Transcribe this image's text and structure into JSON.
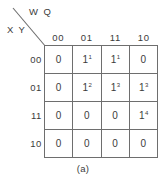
{
  "figure": {
    "caption": "(a)",
    "line_color": "#6e6e6e",
    "text_color": "#3b3b3b",
    "background": "#ffffff"
  },
  "axis_labels": {
    "top": "W Q",
    "left": "X Y"
  },
  "chart_data": {
    "type": "table",
    "title": "",
    "subtitle": "",
    "xlabel": "W Q",
    "ylabel": "X Y",
    "categories": [
      "00",
      "01",
      "11",
      "10"
    ],
    "row_categories": [
      "00",
      "01",
      "11",
      "10"
    ],
    "column_headers": [
      "00",
      "01",
      "11",
      "10"
    ],
    "row_headers": [
      "00",
      "01",
      "11",
      "10"
    ],
    "grid": true,
    "legend": "none",
    "cells": [
      [
        {
          "value": "0",
          "group": ""
        },
        {
          "value": "1",
          "group": "1"
        },
        {
          "value": "1",
          "group": "1"
        },
        {
          "value": "0",
          "group": ""
        }
      ],
      [
        {
          "value": "0",
          "group": ""
        },
        {
          "value": "1",
          "group": "2"
        },
        {
          "value": "1",
          "group": "3"
        },
        {
          "value": "1",
          "group": "3"
        }
      ],
      [
        {
          "value": "0",
          "group": ""
        },
        {
          "value": "0",
          "group": ""
        },
        {
          "value": "0",
          "group": ""
        },
        {
          "value": "1",
          "group": "4"
        }
      ],
      [
        {
          "value": "0",
          "group": ""
        },
        {
          "value": "0",
          "group": ""
        },
        {
          "value": "0",
          "group": ""
        },
        {
          "value": "0",
          "group": ""
        }
      ]
    ]
  }
}
